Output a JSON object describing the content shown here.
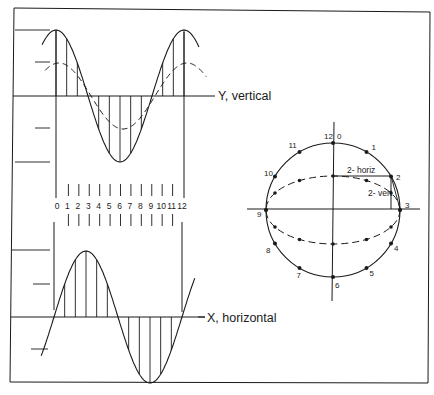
{
  "diagram": {
    "labels": {
      "y_axis": "Y, vertical",
      "x_axis": "X, horizontal",
      "horiz_component": "2- horiz",
      "vert_component": "2- vert"
    },
    "timeline_ticks": [
      "0",
      "1",
      "2",
      "3",
      "4",
      "5",
      "6",
      "7",
      "8",
      "9",
      "10",
      "11",
      "12"
    ],
    "clock_points": [
      {
        "label": "12",
        "angle_deg": 90
      },
      {
        "label": "0",
        "angle_deg": 90
      },
      {
        "label": "1",
        "angle_deg": 60
      },
      {
        "label": "2",
        "angle_deg": 30
      },
      {
        "label": "3",
        "angle_deg": 0
      },
      {
        "label": "4",
        "angle_deg": -30
      },
      {
        "label": "5",
        "angle_deg": -60
      },
      {
        "label": "6",
        "angle_deg": -90
      },
      {
        "label": "7",
        "angle_deg": -120
      },
      {
        "label": "8",
        "angle_deg": -150
      },
      {
        "label": "9",
        "angle_deg": 180
      },
      {
        "label": "10",
        "angle_deg": 150
      },
      {
        "label": "11",
        "angle_deg": 120
      }
    ],
    "colors": {
      "ink": "#1a1a1a",
      "background": "#ffffff"
    }
  }
}
